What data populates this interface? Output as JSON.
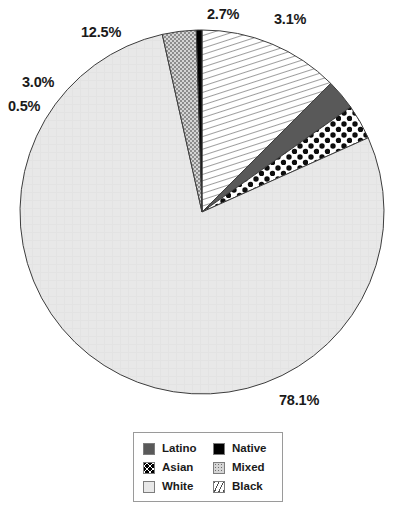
{
  "chart_data": {
    "type": "pie",
    "title": "",
    "labels": [
      "Black",
      "Latino",
      "Asian",
      "White",
      "Mixed",
      "Native"
    ],
    "values": [
      12.5,
      2.7,
      3.1,
      78.1,
      3.0,
      0.5
    ],
    "value_labels": [
      "12.5%",
      "2.7%",
      "3.1%",
      "78.1%",
      "3.0%",
      "0.5%"
    ],
    "legend_position": "bottom",
    "grid": false,
    "xlabel": "",
    "ylabel": "",
    "slices": [
      {
        "name": "Black",
        "value": 12.5,
        "label": "12.5%",
        "pattern": "diagonal-hatch",
        "color": "#f2f2f2"
      },
      {
        "name": "Latino",
        "value": 2.7,
        "label": "2.7%",
        "pattern": "solid-dark",
        "color": "#595959"
      },
      {
        "name": "Asian",
        "value": 3.1,
        "label": "3.1%",
        "pattern": "polka-dots",
        "color": "#ffffff"
      },
      {
        "name": "White",
        "value": 78.1,
        "label": "78.1%",
        "pattern": "solid-light",
        "color": "#e8e8e8"
      },
      {
        "name": "Mixed",
        "value": 3.0,
        "label": "3.0%",
        "pattern": "stipple",
        "color": "#c9c9c9"
      },
      {
        "name": "Native",
        "value": 0.5,
        "label": "0.5%",
        "pattern": "solid-black",
        "color": "#000000"
      }
    ]
  },
  "labels": {
    "black": "12.5%",
    "latino": "2.7%",
    "asian": "3.1%",
    "white": "78.1%",
    "mixed": "3.0%",
    "native": "0.5%"
  },
  "legend": {
    "items": [
      {
        "label": "Latino",
        "pattern": "solid-dark"
      },
      {
        "label": "Native",
        "pattern": "solid-black"
      },
      {
        "label": "Asian",
        "pattern": "polka-dots"
      },
      {
        "label": "Mixed",
        "pattern": "stipple"
      },
      {
        "label": "White",
        "pattern": "solid-light"
      },
      {
        "label": "Black",
        "pattern": "diagonal-hatch"
      }
    ]
  }
}
